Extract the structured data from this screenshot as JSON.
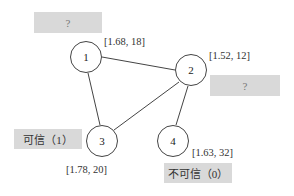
{
  "nodes": [
    {
      "id": "1",
      "label": "1",
      "attr": "[1.68, 18]"
    },
    {
      "id": "2",
      "label": "2",
      "attr": "[1.52, 12]"
    },
    {
      "id": "3",
      "label": "3",
      "attr": "[1.78, 20]"
    },
    {
      "id": "4",
      "label": "4",
      "attr": "[1.63, 32]"
    }
  ],
  "edges": [
    [
      "1",
      "2"
    ],
    [
      "1",
      "3"
    ],
    [
      "2",
      "3"
    ],
    [
      "2",
      "4"
    ]
  ],
  "labels": {
    "node1": "?",
    "node2": "?",
    "node3": "可信（1）",
    "node4": "不可信（0）"
  },
  "colors": {
    "label_box": "#d9d9d9",
    "edge": "#444444"
  }
}
